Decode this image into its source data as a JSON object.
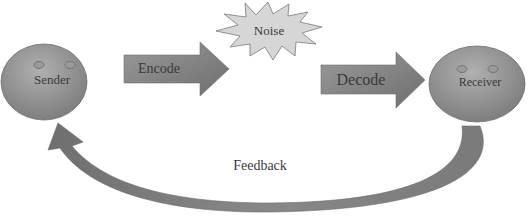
{
  "diagram": {
    "nodes": {
      "sender": {
        "label": "Sender"
      },
      "receiver": {
        "label": "Receiver"
      },
      "noise": {
        "label": "Noise"
      }
    },
    "arrows": {
      "encode": {
        "label": "Encode"
      },
      "decode": {
        "label": "Decode"
      },
      "feedback": {
        "label": "Feedback"
      }
    },
    "colors": {
      "shape_fill": "#8c8c8c",
      "shape_light": "#b5b5b5",
      "noise_fill": "#d6d6d6",
      "text": "#3a3a3a"
    }
  }
}
